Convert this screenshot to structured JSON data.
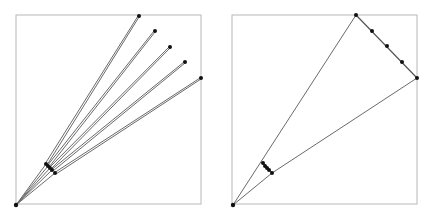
{
  "colors": {
    "frame": "#b8b8b8",
    "ray": "#6a6a6a",
    "dot": "#111111",
    "background": "#ffffff"
  },
  "panels": [
    {
      "name": "left-panel",
      "frame": {
        "x": 16,
        "y": 15,
        "w": 185,
        "h": 189
      },
      "origin": [
        16,
        205
      ],
      "far_points": [
        [
          139,
          16
        ],
        [
          155,
          31
        ],
        [
          170,
          47
        ],
        [
          185,
          62
        ],
        [
          201,
          78
        ]
      ],
      "near_points": [
        [
          46,
          164
        ],
        [
          48,
          166
        ],
        [
          50,
          168
        ],
        [
          52,
          170
        ],
        [
          55,
          173
        ]
      ],
      "description": "Five rays from a common origin, each passing through a near point and ending at a far point; near points clustered."
    },
    {
      "name": "right-panel",
      "frame": {
        "x": 232,
        "y": 15,
        "w": 185,
        "h": 189
      },
      "origin": [
        233,
        205
      ],
      "far_points": [
        [
          356,
          15
        ],
        [
          372,
          31
        ],
        [
          387,
          46
        ],
        [
          402,
          62
        ],
        [
          417,
          78
        ]
      ],
      "near_points": [
        [
          263,
          163
        ],
        [
          265,
          166
        ],
        [
          267,
          168
        ],
        [
          269,
          170
        ],
        [
          272,
          173
        ]
      ],
      "description": "Two outer rays from origin to far extremes; far points lie on a straight segment; near points clustered on a short segment."
    }
  ]
}
